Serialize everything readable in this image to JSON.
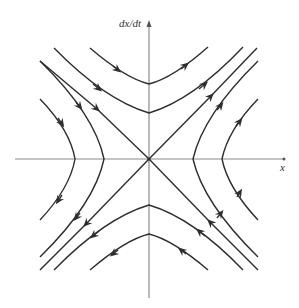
{
  "diagram": {
    "type": "phase-portrait",
    "axes": {
      "x_label": "x",
      "y_label": "dx/dt"
    },
    "colors": {
      "axis": "#8a8a8a",
      "trajectory": "#2e2e2e",
      "background": "#ffffff"
    }
  }
}
